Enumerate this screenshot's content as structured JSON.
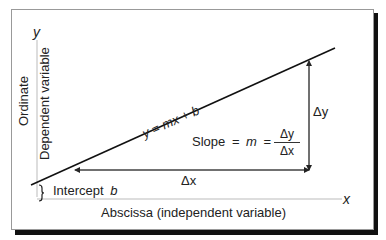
{
  "diagram": {
    "axes": {
      "y_label": "y",
      "x_label": "x",
      "ordinate_label": "Ordinate",
      "dependent_label": "Dependent variable",
      "abscissa_label": "Abscissa (independent variable)"
    },
    "line": {
      "equation_y": "y",
      "equation_eq": "=",
      "equation_mx": "mx",
      "equation_plus": "+",
      "equation_b": "b"
    },
    "slope": {
      "label": "Slope",
      "eq1": "=",
      "m": "m",
      "eq2": "=",
      "numerator": "Δy",
      "denominator": "Δx"
    },
    "delta_x": "Δx",
    "delta_y": "Δy",
    "intercept": {
      "label": "Intercept",
      "symbol": "b"
    },
    "colors": {
      "line": "#111111",
      "axis": "#bbbbbb",
      "text": "#222222",
      "shadow": "#111111"
    }
  }
}
